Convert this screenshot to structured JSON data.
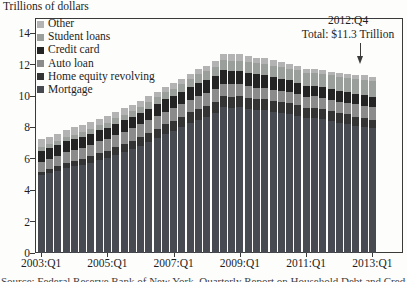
{
  "title": "Trillions of dollars",
  "annotation": {
    "line1": "2012:Q4",
    "line2": "Total: $11.3 Trillion"
  },
  "caption_partial": "Source: Federal Reserve Bank of New York, Quarterly Report on Household Debt and Credit",
  "colors": {
    "background": "#fdfdfc",
    "axis": "#3a3a3a",
    "text": "#1e1e1e"
  },
  "chart_data": {
    "type": "bar",
    "stacked": true,
    "title": "Trillions of dollars",
    "xlabel": "",
    "ylabel": "Trillions of dollars",
    "ylim": [
      0,
      15
    ],
    "y_ticks": [
      0,
      2,
      4,
      6,
      8,
      10,
      12,
      14
    ],
    "grid": false,
    "legend_position": "top-left-inside",
    "x": [
      "2003:Q1",
      "2003:Q2",
      "2003:Q3",
      "2003:Q4",
      "2004:Q1",
      "2004:Q2",
      "2004:Q3",
      "2004:Q4",
      "2005:Q1",
      "2005:Q2",
      "2005:Q3",
      "2005:Q4",
      "2006:Q1",
      "2006:Q2",
      "2006:Q3",
      "2006:Q4",
      "2007:Q1",
      "2007:Q2",
      "2007:Q3",
      "2007:Q4",
      "2008:Q1",
      "2008:Q2",
      "2008:Q3",
      "2008:Q4",
      "2009:Q1",
      "2009:Q2",
      "2009:Q3",
      "2009:Q4",
      "2010:Q1",
      "2010:Q2",
      "2010:Q3",
      "2010:Q4",
      "2011:Q1",
      "2011:Q2",
      "2011:Q3",
      "2011:Q4",
      "2012:Q1",
      "2012:Q2",
      "2012:Q3",
      "2012:Q4",
      "2013:Q1"
    ],
    "x_tick_labels": [
      "2003:Q1",
      "2005:Q1",
      "2007:Q1",
      "2009:Q1",
      "2011:Q1",
      "2013:Q1"
    ],
    "series": [
      {
        "name": "Mortgage",
        "color": "#474a50",
        "values": [
          4.94,
          5.08,
          5.24,
          5.41,
          5.53,
          5.63,
          5.75,
          5.92,
          6.03,
          6.23,
          6.41,
          6.6,
          6.82,
          7.06,
          7.3,
          7.57,
          7.77,
          8.02,
          8.28,
          8.5,
          8.66,
          8.91,
          9.29,
          9.26,
          9.27,
          9.17,
          9.1,
          9.09,
          8.99,
          8.94,
          8.87,
          8.75,
          8.6,
          8.62,
          8.55,
          8.4,
          8.29,
          8.24,
          8.12,
          8.03,
          7.93
        ]
      },
      {
        "name": "Home equity revolving",
        "color": "#343434",
        "values": [
          0.24,
          0.26,
          0.28,
          0.3,
          0.33,
          0.36,
          0.4,
          0.44,
          0.47,
          0.5,
          0.52,
          0.54,
          0.56,
          0.58,
          0.6,
          0.62,
          0.63,
          0.65,
          0.67,
          0.68,
          0.7,
          0.71,
          0.69,
          0.7,
          0.71,
          0.71,
          0.71,
          0.7,
          0.69,
          0.68,
          0.67,
          0.66,
          0.65,
          0.64,
          0.63,
          0.62,
          0.61,
          0.59,
          0.57,
          0.56,
          0.55
        ]
      },
      {
        "name": "Auto loan",
        "color": "#8b8b8b",
        "values": [
          0.64,
          0.66,
          0.68,
          0.7,
          0.7,
          0.72,
          0.74,
          0.76,
          0.76,
          0.78,
          0.8,
          0.81,
          0.81,
          0.82,
          0.82,
          0.82,
          0.81,
          0.82,
          0.82,
          0.83,
          0.82,
          0.82,
          0.81,
          0.79,
          0.77,
          0.75,
          0.73,
          0.71,
          0.7,
          0.69,
          0.69,
          0.7,
          0.7,
          0.71,
          0.72,
          0.73,
          0.74,
          0.75,
          0.77,
          0.78,
          0.8
        ]
      },
      {
        "name": "Credit card",
        "color": "#242424",
        "values": [
          0.69,
          0.69,
          0.69,
          0.7,
          0.69,
          0.69,
          0.7,
          0.72,
          0.71,
          0.72,
          0.73,
          0.74,
          0.73,
          0.74,
          0.75,
          0.77,
          0.77,
          0.79,
          0.81,
          0.84,
          0.84,
          0.85,
          0.87,
          0.87,
          0.85,
          0.84,
          0.84,
          0.84,
          0.8,
          0.77,
          0.76,
          0.73,
          0.69,
          0.69,
          0.69,
          0.7,
          0.68,
          0.67,
          0.67,
          0.68,
          0.66
        ]
      },
      {
        "name": "Student loans",
        "color": "#9b9f9b",
        "values": [
          0.24,
          0.25,
          0.26,
          0.27,
          0.28,
          0.29,
          0.3,
          0.31,
          0.33,
          0.34,
          0.36,
          0.38,
          0.4,
          0.42,
          0.44,
          0.45,
          0.48,
          0.5,
          0.52,
          0.54,
          0.56,
          0.58,
          0.61,
          0.63,
          0.66,
          0.68,
          0.7,
          0.71,
          0.72,
          0.74,
          0.76,
          0.79,
          0.8,
          0.82,
          0.84,
          0.87,
          0.9,
          0.91,
          0.94,
          0.97,
          0.99
        ]
      },
      {
        "name": "Other",
        "color": "#b3b3b3",
        "values": [
          0.48,
          0.47,
          0.46,
          0.47,
          0.49,
          0.48,
          0.45,
          0.41,
          0.4,
          0.4,
          0.39,
          0.37,
          0.39,
          0.38,
          0.37,
          0.36,
          0.34,
          0.31,
          0.32,
          0.35,
          0.35,
          0.38,
          0.41,
          0.43,
          0.4,
          0.37,
          0.36,
          0.38,
          0.37,
          0.34,
          0.31,
          0.3,
          0.28,
          0.24,
          0.23,
          0.21,
          0.22,
          0.22,
          0.24,
          0.29,
          0.3
        ]
      }
    ],
    "legend_order": [
      "Other",
      "Student loans",
      "Credit card",
      "Auto loan",
      "Home equity revolving",
      "Mortgage"
    ],
    "annotated_bar": {
      "x": "2012:Q4",
      "total": 11.3
    }
  }
}
